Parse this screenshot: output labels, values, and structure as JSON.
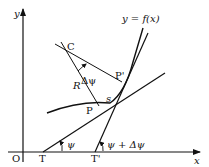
{
  "diagram": {
    "type": "geometry",
    "labels": {
      "y_axis": "y",
      "x_axis": "x",
      "origin": "O",
      "curve": "y = f(x)",
      "center": "C",
      "radius": "R",
      "delta_psi": "Δψ",
      "point_p": "P",
      "point_p_prime": "P'",
      "arc_s": "s",
      "point_t": "T",
      "point_t_prime": "T'",
      "angle_psi": "ψ",
      "angle_psi_plus": "ψ + Δψ"
    },
    "colors": {
      "stroke": "#111111",
      "background": "#ffffff"
    }
  }
}
